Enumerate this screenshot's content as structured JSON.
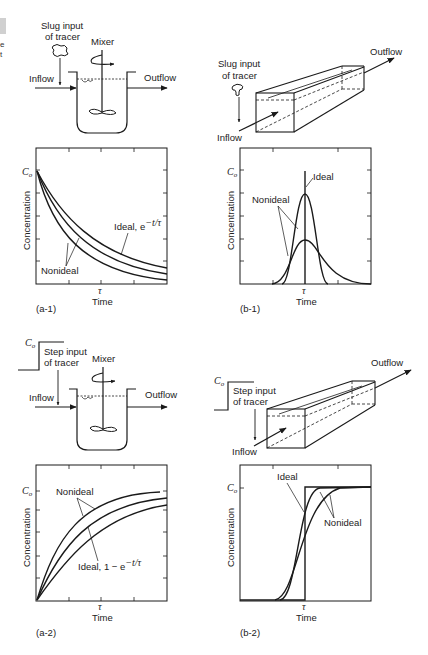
{
  "edge_fragments": [
    "e",
    "t"
  ],
  "panels": {
    "a1": {
      "caption": "(a-1)",
      "diagram": {
        "input_label_1": "Slug input",
        "input_label_2": "of tracer",
        "mixer_label": "Mixer",
        "inflow_label": "Inflow",
        "outflow_label": "Outflow"
      },
      "plot": {
        "ylabel": "Concentration",
        "xlabel": "Time",
        "y_marker": "C",
        "y_marker_sub": "o",
        "x_marker": "τ",
        "annot_ideal": "Ideal, e",
        "annot_ideal_sup": "−t/τ",
        "annot_nonideal": "Nonideal"
      }
    },
    "b1": {
      "caption": "(b-1)",
      "diagram": {
        "input_label_1": "Slug input",
        "input_label_2": "of tracer",
        "inflow_label": "Inflow",
        "outflow_label": "Outflow"
      },
      "plot": {
        "ylabel": "Concentration",
        "xlabel": "Time",
        "y_marker": "C",
        "y_marker_sub": "o",
        "x_marker": "τ",
        "annot_ideal": "Ideal",
        "annot_nonideal": "Nonideal"
      }
    },
    "a2": {
      "caption": "(a-2)",
      "diagram": {
        "step_marker": "C",
        "step_marker_sub": "o",
        "input_label_1": "Step input",
        "input_label_2": "of tracer",
        "mixer_label": "Mixer",
        "inflow_label": "Inflow",
        "outflow_label": "Outflow"
      },
      "plot": {
        "ylabel": "Concentration",
        "xlabel": "Time",
        "y_marker": "C",
        "y_marker_sub": "o",
        "x_marker": "τ",
        "annot_ideal": "Ideal, 1 − e",
        "annot_ideal_sup": "−t/τ",
        "annot_nonideal": "Nonideal"
      }
    },
    "b2": {
      "caption": "(b-2)",
      "diagram": {
        "step_marker": "C",
        "step_marker_sub": "o",
        "input_label_1": "Step input",
        "input_label_2": "of tracer",
        "inflow_label": "Inflow",
        "outflow_label": "Outflow"
      },
      "plot": {
        "ylabel": "Concentration",
        "xlabel": "Time",
        "y_marker": "C",
        "y_marker_sub": "o",
        "x_marker": "τ",
        "annot_ideal": "Ideal",
        "annot_nonideal": "Nonideal"
      }
    }
  },
  "colors": {
    "ink": "#1a1a1a",
    "background": "#ffffff"
  }
}
